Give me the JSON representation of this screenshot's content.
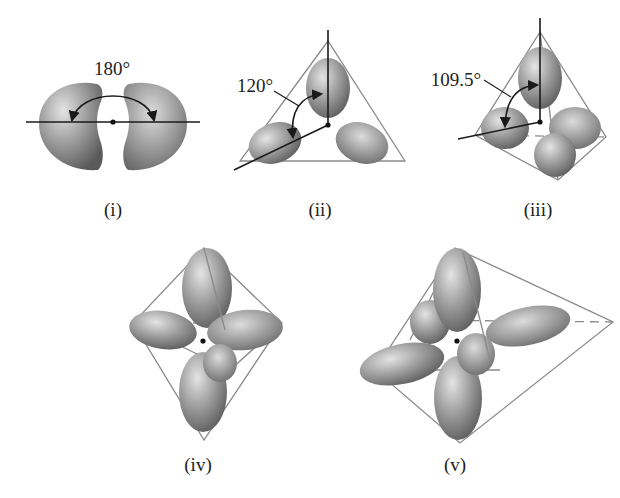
{
  "figure": {
    "panels": [
      {
        "id": "i",
        "caption": "(i)",
        "angle_label": "180°",
        "geometry": "linear"
      },
      {
        "id": "ii",
        "caption": "(ii)",
        "angle_label": "120°",
        "geometry": "trigonal planar"
      },
      {
        "id": "iii",
        "caption": "(iii)",
        "angle_label": "109.5°",
        "geometry": "tetrahedral"
      },
      {
        "id": "iv",
        "caption": "(iv)",
        "angle_label": "",
        "geometry": "trigonal bipyramidal"
      },
      {
        "id": "v",
        "caption": "(v)",
        "angle_label": "",
        "geometry": "octahedral"
      }
    ],
    "colors": {
      "lobe_light": "#d8d8d8",
      "lobe_mid": "#9a9a9a",
      "lobe_dark": "#5e5e5e",
      "edge": "#8a8a8a",
      "axis": "#1a1a1a",
      "background": "#ffffff"
    }
  }
}
